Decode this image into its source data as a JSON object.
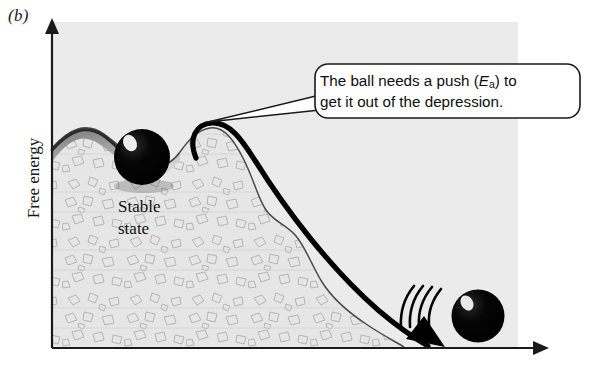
{
  "figure": {
    "panel_label": "(b)",
    "y_axis_title": "Free energy",
    "terrain_label_line1": "Stable",
    "terrain_label_line2": "state",
    "callout": {
      "line1_before": "The ball needs a push (",
      "line1_symbol": "E",
      "line1_subscript": "a",
      "line1_after": ") to",
      "line2": "get it out of the depression."
    },
    "colors": {
      "background": "#ffffff",
      "plot_background": "#ebebeb",
      "terrain_fill": "#e3e3e3",
      "terrain_shade": "#8d8d8d",
      "terrain_outline": "#3b3b3b",
      "texture_stroke": "#b7b7b7",
      "ball": "#000000",
      "ball_highlight": "#ffffff",
      "arrow": "#000000",
      "axis": "#1a1a1a",
      "callout_border": "#1a1a1a",
      "callout_fill": "#ffffff",
      "text": "#111111"
    },
    "elements": {
      "energy_barrier_arrow": "thick-curved-arrow-over-hill",
      "motion_lines_count": 4,
      "ball_stable_state": "black-sphere-in-depression",
      "ball_rolled_down": "black-sphere-at-base",
      "y_axis_arrowhead": "up",
      "x_axis_arrowhead": "right"
    }
  }
}
